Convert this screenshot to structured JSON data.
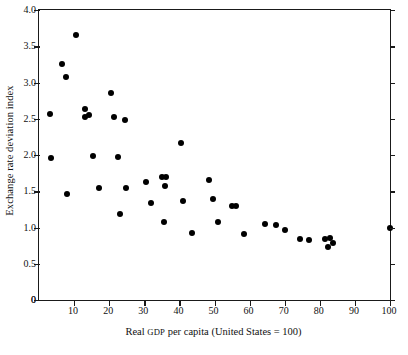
{
  "chart_data": {
    "type": "scatter",
    "title": "",
    "xlabel": "Real GDP per capita (United States = 100)",
    "xlabel_parts": {
      "before": "Real ",
      "smallcaps": "GDP",
      "after": " per capita (United States  =  100)"
    },
    "ylabel": "Exchange rate deviation index",
    "xlim": [
      0,
      100
    ],
    "ylim": [
      0,
      4.0
    ],
    "xticks": [
      0,
      10,
      20,
      30,
      40,
      50,
      60,
      70,
      80,
      90,
      100
    ],
    "xtick_labels": [
      "",
      "10",
      "20",
      "30",
      "40",
      "50",
      "60",
      "70",
      "80",
      "90",
      "100"
    ],
    "yticks": [
      0,
      0.5,
      1.0,
      1.5,
      2.0,
      2.5,
      3.0,
      3.5,
      4.0
    ],
    "ytick_labels": [
      "0",
      "0.5",
      "1.0",
      "1.5",
      "2.0",
      "2.5",
      "3.0",
      "3.5",
      "4.0"
    ],
    "grid": false,
    "legend": null,
    "marker": {
      "shape": "circle",
      "color": "#000000",
      "size": 6
    },
    "points": [
      {
        "x": 3.0,
        "y": 2.56
      },
      {
        "x": 3.4,
        "y": 1.96
      },
      {
        "x": 6.6,
        "y": 3.25
      },
      {
        "x": 7.6,
        "y": 3.08
      },
      {
        "x": 8.0,
        "y": 1.46
      },
      {
        "x": 10.5,
        "y": 3.65
      },
      {
        "x": 13.0,
        "y": 2.63
      },
      {
        "x": 13.2,
        "y": 2.52
      },
      {
        "x": 14.2,
        "y": 2.55
      },
      {
        "x": 15.5,
        "y": 1.98
      },
      {
        "x": 17.0,
        "y": 1.55
      },
      {
        "x": 20.5,
        "y": 2.86
      },
      {
        "x": 21.5,
        "y": 2.53
      },
      {
        "x": 22.5,
        "y": 1.97
      },
      {
        "x": 23.0,
        "y": 1.18
      },
      {
        "x": 24.5,
        "y": 2.48
      },
      {
        "x": 24.8,
        "y": 1.55
      },
      {
        "x": 30.5,
        "y": 1.63
      },
      {
        "x": 32.0,
        "y": 1.34
      },
      {
        "x": 35.0,
        "y": 1.69
      },
      {
        "x": 36.3,
        "y": 1.7
      },
      {
        "x": 35.8,
        "y": 1.57
      },
      {
        "x": 35.5,
        "y": 1.07
      },
      {
        "x": 40.5,
        "y": 2.17
      },
      {
        "x": 41.0,
        "y": 1.36
      },
      {
        "x": 43.5,
        "y": 0.93
      },
      {
        "x": 48.5,
        "y": 1.66
      },
      {
        "x": 49.5,
        "y": 1.39
      },
      {
        "x": 51.0,
        "y": 1.08
      },
      {
        "x": 55.0,
        "y": 1.3
      },
      {
        "x": 56.0,
        "y": 1.3
      },
      {
        "x": 58.5,
        "y": 0.91
      },
      {
        "x": 64.5,
        "y": 1.05
      },
      {
        "x": 67.5,
        "y": 1.03
      },
      {
        "x": 70.0,
        "y": 0.97
      },
      {
        "x": 74.5,
        "y": 0.84
      },
      {
        "x": 77.0,
        "y": 0.83
      },
      {
        "x": 81.5,
        "y": 0.84
      },
      {
        "x": 82.3,
        "y": 0.73
      },
      {
        "x": 83.0,
        "y": 0.86
      },
      {
        "x": 83.8,
        "y": 0.79
      },
      {
        "x": 100.0,
        "y": 1.0
      }
    ]
  }
}
